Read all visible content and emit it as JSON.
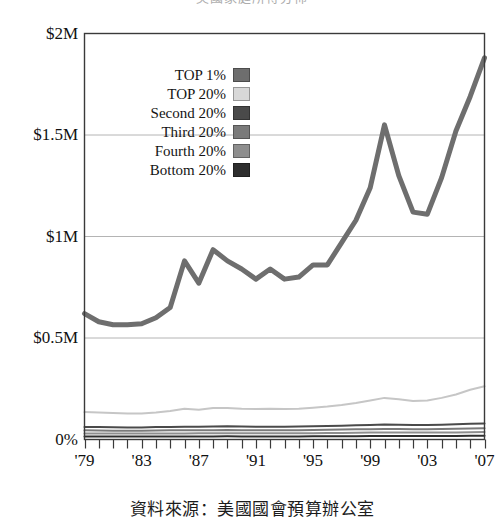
{
  "chart_data": {
    "type": "line",
    "title": "美國家庭所得分佈",
    "caption": "資料來源：美國國會預算辦公室",
    "xlabel": "",
    "ylabel": "",
    "xlim": [
      1979,
      2007
    ],
    "ylim": [
      0,
      2000000
    ],
    "grid": true,
    "grid_axis": "y",
    "legend_position": "inside-upper-left",
    "y_ticks": [
      {
        "value": 2000000,
        "label": "$2M"
      },
      {
        "value": 1500000,
        "label": "$1.5M"
      },
      {
        "value": 1000000,
        "label": "$1M"
      },
      {
        "value": 500000,
        "label": "$0.5M"
      },
      {
        "value": 0,
        "label": "0%"
      }
    ],
    "x_ticks": [
      {
        "value": 1979,
        "label": "'79"
      },
      {
        "value": 1983,
        "label": "'83"
      },
      {
        "value": 1987,
        "label": "'87"
      },
      {
        "value": 1991,
        "label": "'91"
      },
      {
        "value": 1995,
        "label": "'95"
      },
      {
        "value": 1999,
        "label": "'99"
      },
      {
        "value": 2003,
        "label": "'03"
      },
      {
        "value": 2007,
        "label": "'07"
      }
    ],
    "x": [
      1979,
      1980,
      1981,
      1982,
      1983,
      1984,
      1985,
      1986,
      1987,
      1988,
      1989,
      1990,
      1991,
      1992,
      1993,
      1994,
      1995,
      1996,
      1997,
      1998,
      1999,
      2000,
      2001,
      2002,
      2003,
      2004,
      2005,
      2006,
      2007
    ],
    "series": [
      {
        "name": "TOP 1%",
        "color": "#6e6e6e",
        "width": 5,
        "values": [
          620000,
          580000,
          565000,
          565000,
          570000,
          600000,
          650000,
          880000,
          770000,
          935000,
          880000,
          840000,
          790000,
          840000,
          790000,
          800000,
          860000,
          860000,
          970000,
          1080000,
          1240000,
          1550000,
          1300000,
          1120000,
          1110000,
          1290000,
          1520000,
          1690000,
          1880000
        ]
      },
      {
        "name": "TOP 20%",
        "color": "#c6c6c6",
        "width": 2,
        "values": [
          135000,
          133000,
          130000,
          128000,
          128000,
          133000,
          140000,
          152000,
          147000,
          155000,
          155000,
          151000,
          150000,
          152000,
          150000,
          152000,
          157000,
          162000,
          170000,
          180000,
          192000,
          205000,
          198000,
          190000,
          192000,
          205000,
          222000,
          245000,
          262000
        ]
      },
      {
        "name": "Second 20%",
        "color": "#4a4a4a",
        "width": 2,
        "values": [
          62000,
          61000,
          60000,
          59000,
          59000,
          61000,
          62000,
          63000,
          63000,
          64000,
          65000,
          64000,
          63000,
          63000,
          63000,
          64000,
          65000,
          66000,
          68000,
          70000,
          72000,
          74000,
          73000,
          72000,
          72000,
          73000,
          75000,
          77000,
          79000
        ]
      },
      {
        "name": "Third 20%",
        "color": "#7a7a7a",
        "width": 2,
        "values": [
          45000,
          44000,
          43000,
          43000,
          43000,
          44000,
          45000,
          45000,
          46000,
          46000,
          47000,
          46000,
          46000,
          46000,
          46000,
          46000,
          47000,
          48000,
          49000,
          50000,
          51000,
          52000,
          52000,
          51000,
          51000,
          52000,
          53000,
          54000,
          55000
        ]
      },
      {
        "name": "Fourth 20%",
        "color": "#8e8e8e",
        "width": 2,
        "values": [
          30000,
          29500,
          29000,
          29000,
          29000,
          29500,
          30000,
          30000,
          30500,
          31000,
          31000,
          31000,
          30500,
          30500,
          30500,
          31000,
          31000,
          31500,
          32000,
          33000,
          34000,
          34500,
          34000,
          34000,
          34000,
          34500,
          35000,
          36000,
          36500
        ]
      },
      {
        "name": "Bottom 20%",
        "color": "#2e2e2e",
        "width": 2,
        "values": [
          15000,
          14800,
          14500,
          14300,
          14300,
          14500,
          14800,
          15000,
          15000,
          15200,
          15500,
          15300,
          15000,
          15000,
          15000,
          15200,
          15400,
          15600,
          16000,
          16500,
          17000,
          17500,
          17200,
          17000,
          17000,
          17200,
          17500,
          18000,
          18400
        ]
      }
    ]
  },
  "legend": {
    "items": [
      {
        "label": "TOP 1%",
        "color": "#6e6e6e"
      },
      {
        "label": "TOP 20%",
        "color": "#d8d8d8"
      },
      {
        "label": "Second 20%",
        "color": "#4a4a4a"
      },
      {
        "label": "Third 20%",
        "color": "#7a7a7a"
      },
      {
        "label": "Fourth 20%",
        "color": "#8e8e8e"
      },
      {
        "label": "Bottom 20%",
        "color": "#2e2e2e"
      }
    ]
  },
  "axes": {
    "frame_color": "#3a3a3a",
    "grid_color": "#b4b4b4"
  }
}
